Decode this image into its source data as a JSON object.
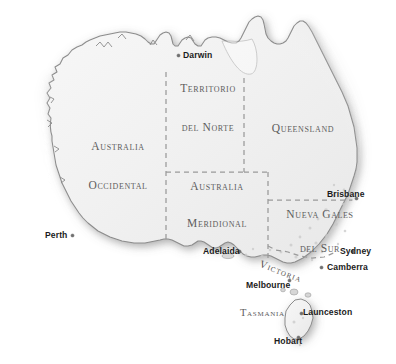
{
  "map": {
    "title": "Mapa politico de Australia",
    "language": "Spanish",
    "background_color": "#ffffff",
    "land_color": "#f2f2f2",
    "coast_stroke_color": "#8c8c8c",
    "border_dash_color": "#9a9a9a",
    "region_label_color": "#5d5d5d",
    "city_label_color": "#1b1b1b",
    "city_dot_color": "#6f6f6f"
  },
  "regions": [
    {
      "id": "western-australia",
      "line1": "Australia",
      "line2": "Occidental"
    },
    {
      "id": "northern-territory",
      "line1": "Territorio",
      "line2": "del Norte"
    },
    {
      "id": "queensland",
      "line1": "Queensland",
      "line2": ""
    },
    {
      "id": "south-australia",
      "line1": "Australia",
      "line2": "Meridional"
    },
    {
      "id": "new-south-wales",
      "line1": "Nueva Gales",
      "line2": "del Sur"
    },
    {
      "id": "victoria",
      "line1": "Victoria",
      "line2": ""
    },
    {
      "id": "tasmania-region",
      "line1": "Tasmania",
      "line2": ""
    }
  ],
  "cities": [
    {
      "id": "darwin",
      "name": "Darwin"
    },
    {
      "id": "perth",
      "name": "Perth"
    },
    {
      "id": "brisbane",
      "name": "Brisbane"
    },
    {
      "id": "adelaida",
      "name": "Adelaida"
    },
    {
      "id": "sydney",
      "name": "Sydney"
    },
    {
      "id": "camberra",
      "name": "Camberra"
    },
    {
      "id": "melbourne",
      "name": "Melbourne"
    },
    {
      "id": "launceston",
      "name": "Launceston"
    },
    {
      "id": "hobart",
      "name": "Hobart"
    }
  ]
}
